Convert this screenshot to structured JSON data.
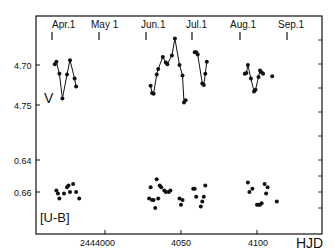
{
  "figure": {
    "month_labels": [
      "Apr.1",
      "May 1",
      "Jun.1",
      "Jul.1",
      "Aug.1",
      "Sep.1"
    ],
    "x_tick_labels": [
      "2444000",
      "4050",
      "4100"
    ],
    "x_axis_label": "HJD",
    "v_panel_label": "V",
    "ub_panel_label": "[U-B]",
    "v_tick_labels": [
      "4.70",
      "4.75"
    ],
    "ub_tick_labels": [
      "0.64",
      "0.66"
    ]
  },
  "chart_data": {
    "type": "scatter",
    "title": "",
    "xlabel": "HJD",
    "x_ticks": [
      {
        "value": 2444000,
        "label": "2444000"
      },
      {
        "value": 2444050,
        "label": "4050"
      },
      {
        "value": 2444100,
        "label": "4100"
      }
    ],
    "top_axis_months": [
      {
        "label": "Apr.1",
        "hjd": 2443965
      },
      {
        "label": "May 1",
        "hjd": 2443995
      },
      {
        "label": "Jun.1",
        "hjd": 2444026
      },
      {
        "label": "Jul.1",
        "hjd": 2444056
      },
      {
        "label": "Aug.1",
        "hjd": 2444087
      },
      {
        "label": "Sep.1",
        "hjd": 2444118
      }
    ],
    "series": [
      {
        "name": "V",
        "ylabel": "V (mag)",
        "ylim_inverted": [
          4.68,
          4.79
        ],
        "y_ticks": [
          4.7,
          4.75
        ],
        "connected_segments": true,
        "points": [
          [
            2443967,
            4.699
          ],
          [
            2443968,
            4.696
          ],
          [
            2443970,
            4.711
          ],
          [
            2443972,
            4.742
          ],
          [
            2443975,
            4.712
          ],
          [
            2443977,
            4.694
          ],
          [
            2443980,
            4.717
          ],
          [
            2443981,
            4.727
          ],
          [
            2444030,
            4.726
          ],
          [
            2444031,
            4.735
          ],
          [
            2444032,
            4.736
          ],
          [
            2444034,
            4.712
          ],
          [
            2444035,
            4.705
          ],
          [
            2444038,
            4.69
          ],
          [
            2444040,
            4.697
          ],
          [
            2444041,
            4.699
          ],
          [
            2444044,
            4.688
          ],
          [
            2444046,
            4.667
          ],
          [
            2444049,
            4.7
          ],
          [
            2444051,
            4.713
          ],
          [
            2444052,
            4.747
          ],
          [
            2444053,
            4.744
          ],
          [
            2444059,
            4.684
          ],
          [
            2444060,
            4.684
          ],
          [
            2444061,
            4.687
          ],
          [
            2444064,
            4.723
          ],
          [
            2444065,
            4.725
          ],
          [
            2444066,
            4.711
          ],
          [
            2444067,
            4.696
          ],
          [
            2444092,
            4.711
          ],
          [
            2444093,
            4.71
          ],
          [
            2444094,
            4.7
          ],
          [
            2444096,
            4.717
          ],
          [
            2444098,
            4.733
          ],
          [
            2444099,
            4.731
          ],
          [
            2444101,
            4.715
          ],
          [
            2444102,
            4.707
          ],
          [
            2444103,
            4.709
          ],
          [
            2444104,
            4.711
          ],
          [
            2444110,
            4.714
          ]
        ]
      },
      {
        "name": "[U-B]",
        "ylabel": "U-B (mag)",
        "ylim_inverted": [
          0.635,
          0.675
        ],
        "y_ticks": [
          0.64,
          0.66
        ],
        "connected_segments": false,
        "points": [
          [
            2443968,
            0.659
          ],
          [
            2443969,
            0.661
          ],
          [
            2443970,
            0.664
          ],
          [
            2443973,
            0.661
          ],
          [
            2443975,
            0.657
          ],
          [
            2443976,
            0.656
          ],
          [
            2443977,
            0.66
          ],
          [
            2443979,
            0.655
          ],
          [
            2443981,
            0.66
          ],
          [
            2443983,
            0.664
          ],
          [
            2444029,
            0.664
          ],
          [
            2444030,
            0.657
          ],
          [
            2444031,
            0.665
          ],
          [
            2444032,
            0.665
          ],
          [
            2444033,
            0.67
          ],
          [
            2444034,
            0.652
          ],
          [
            2444035,
            0.664
          ],
          [
            2444036,
            0.656
          ],
          [
            2444037,
            0.657
          ],
          [
            2444039,
            0.659
          ],
          [
            2444040,
            0.66
          ],
          [
            2444042,
            0.66
          ],
          [
            2444043,
            0.659
          ],
          [
            2444049,
            0.664
          ],
          [
            2444050,
            0.668
          ],
          [
            2444051,
            0.665
          ],
          [
            2444058,
            0.658
          ],
          [
            2444059,
            0.658
          ],
          [
            2444060,
            0.663
          ],
          [
            2444063,
            0.669
          ],
          [
            2444064,
            0.666
          ],
          [
            2444065,
            0.663
          ],
          [
            2444066,
            0.656
          ],
          [
            2444094,
            0.654
          ],
          [
            2444095,
            0.66
          ],
          [
            2444097,
            0.658
          ],
          [
            2444100,
            0.668
          ],
          [
            2444101,
            0.668
          ],
          [
            2444102,
            0.668
          ],
          [
            2444103,
            0.667
          ],
          [
            2444105,
            0.655
          ],
          [
            2444106,
            0.661
          ],
          [
            2444107,
            0.657
          ],
          [
            2444113,
            0.666
          ]
        ]
      }
    ],
    "grid": false,
    "legend": "none"
  }
}
